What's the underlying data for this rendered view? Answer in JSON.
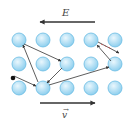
{
  "labels": {
    "field": "E",
    "drift_velocity": "v",
    "vector_mark": "→"
  },
  "colors": {
    "atom_fill_light": "#e8f6fd",
    "atom_fill_dark": "#8ecfee",
    "atom_stroke": "#6bbde3",
    "arrow": "#333333",
    "dash": "#d05050",
    "electron": "#111111"
  },
  "lattice": {
    "rows": 3,
    "columns": 5,
    "x": [
      19,
      43,
      67,
      91,
      115
    ],
    "y": [
      40,
      64,
      88
    ]
  },
  "arrows": {
    "field": {
      "from": [
        95,
        22
      ],
      "to": [
        40,
        22
      ],
      "direction": "left"
    },
    "drift": {
      "from": [
        40,
        103
      ],
      "to": [
        95,
        103
      ],
      "direction": "right"
    }
  },
  "electron_path": [
    {
      "from": [
        14,
        76
      ],
      "to": [
        36,
        86
      ]
    },
    {
      "from": [
        38,
        82
      ],
      "to": [
        23,
        45
      ]
    },
    {
      "from": [
        24,
        44
      ],
      "to": [
        61,
        61
      ]
    },
    {
      "from": [
        62,
        68
      ],
      "to": [
        47,
        83
      ]
    },
    {
      "from": [
        49,
        85
      ],
      "to": [
        109,
        67
      ]
    },
    {
      "from": [
        111,
        61
      ],
      "to": [
        97,
        45
      ]
    },
    {
      "from": [
        98,
        42
      ],
      "to": [
        119,
        53
      ]
    }
  ]
}
